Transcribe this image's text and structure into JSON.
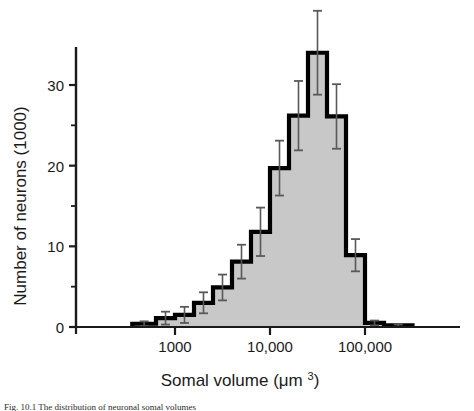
{
  "figure": {
    "caption_clipped": "Fig. 10.1 The distribution of neuronal somal volumes"
  },
  "chart_data": {
    "type": "bar",
    "title": "",
    "subtitle": "",
    "xlabel": "Somal volume (μm³)",
    "ylabel": "Number of neurons (1000)",
    "xscale": "log",
    "yscale": "linear",
    "grid": false,
    "legend": null,
    "xlim": [
      250,
      400000
    ],
    "ylim": [
      0,
      36
    ],
    "y_ticks_major": [
      0,
      10,
      20,
      30
    ],
    "y_ticks_minor": [
      5,
      15,
      25,
      35
    ],
    "x_ticks_major": [
      1000,
      10000,
      100000
    ],
    "x_tick_labels": [
      "1000",
      "10,000",
      "100,000"
    ],
    "bar_edge_color": "#000000",
    "bar_fill_color": "#c8c8c8",
    "errorbar_color": "#595959",
    "axis_color": "#1a1a1a",
    "bin_edges_log10": [
      2.55,
      2.8,
      3.0,
      3.2,
      3.4,
      3.6,
      3.8,
      4.0,
      4.2,
      4.4,
      4.6,
      4.8,
      5.0,
      5.2,
      5.5
    ],
    "bins": [
      {
        "x_left": 355,
        "x_right": 631,
        "value": 0.4,
        "err": 0.3
      },
      {
        "x_left": 631,
        "x_right": 1000,
        "value": 1.1,
        "err": 0.8
      },
      {
        "x_left": 1000,
        "x_right": 1585,
        "value": 1.5,
        "err": 1.0
      },
      {
        "x_left": 1585,
        "x_right": 2512,
        "value": 3.0,
        "err": 1.3
      },
      {
        "x_left": 2512,
        "x_right": 3981,
        "value": 4.9,
        "err": 1.6
      },
      {
        "x_left": 3981,
        "x_right": 6310,
        "value": 8.1,
        "err": 2.1
      },
      {
        "x_left": 6310,
        "x_right": 10000,
        "value": 11.8,
        "err": 3.0
      },
      {
        "x_left": 10000,
        "x_right": 15849,
        "value": 19.7,
        "err": 3.4
      },
      {
        "x_left": 15849,
        "x_right": 25119,
        "value": 26.2,
        "err": 4.3
      },
      {
        "x_left": 25119,
        "x_right": 39811,
        "value": 34.0,
        "err": 5.2
      },
      {
        "x_left": 39811,
        "x_right": 63096,
        "value": 26.1,
        "err": 4.0
      },
      {
        "x_left": 63096,
        "x_right": 100000,
        "value": 8.9,
        "err": 2.0
      },
      {
        "x_left": 100000,
        "x_right": 158489,
        "value": 0.5,
        "err": 0.3
      },
      {
        "x_left": 158489,
        "x_right": 316228,
        "value": 0.2,
        "err": 0.15
      }
    ],
    "values": [
      0.4,
      1.1,
      1.5,
      3.0,
      4.9,
      8.1,
      11.8,
      19.7,
      26.2,
      34.0,
      26.1,
      8.9,
      0.5,
      0.2
    ],
    "errors": [
      0.3,
      0.8,
      1.0,
      1.3,
      1.6,
      2.1,
      3.0,
      3.4,
      4.3,
      5.2,
      4.0,
      2.0,
      0.3,
      0.15
    ],
    "categories": [
      "355-631",
      "631-1000",
      "1000-1585",
      "1585-2512",
      "2512-3981",
      "3981-6310",
      "6310-10000",
      "10000-15849",
      "15849-25119",
      "25119-39811",
      "39811-63096",
      "63096-100000",
      "100000-158489",
      "158489-316228"
    ]
  }
}
